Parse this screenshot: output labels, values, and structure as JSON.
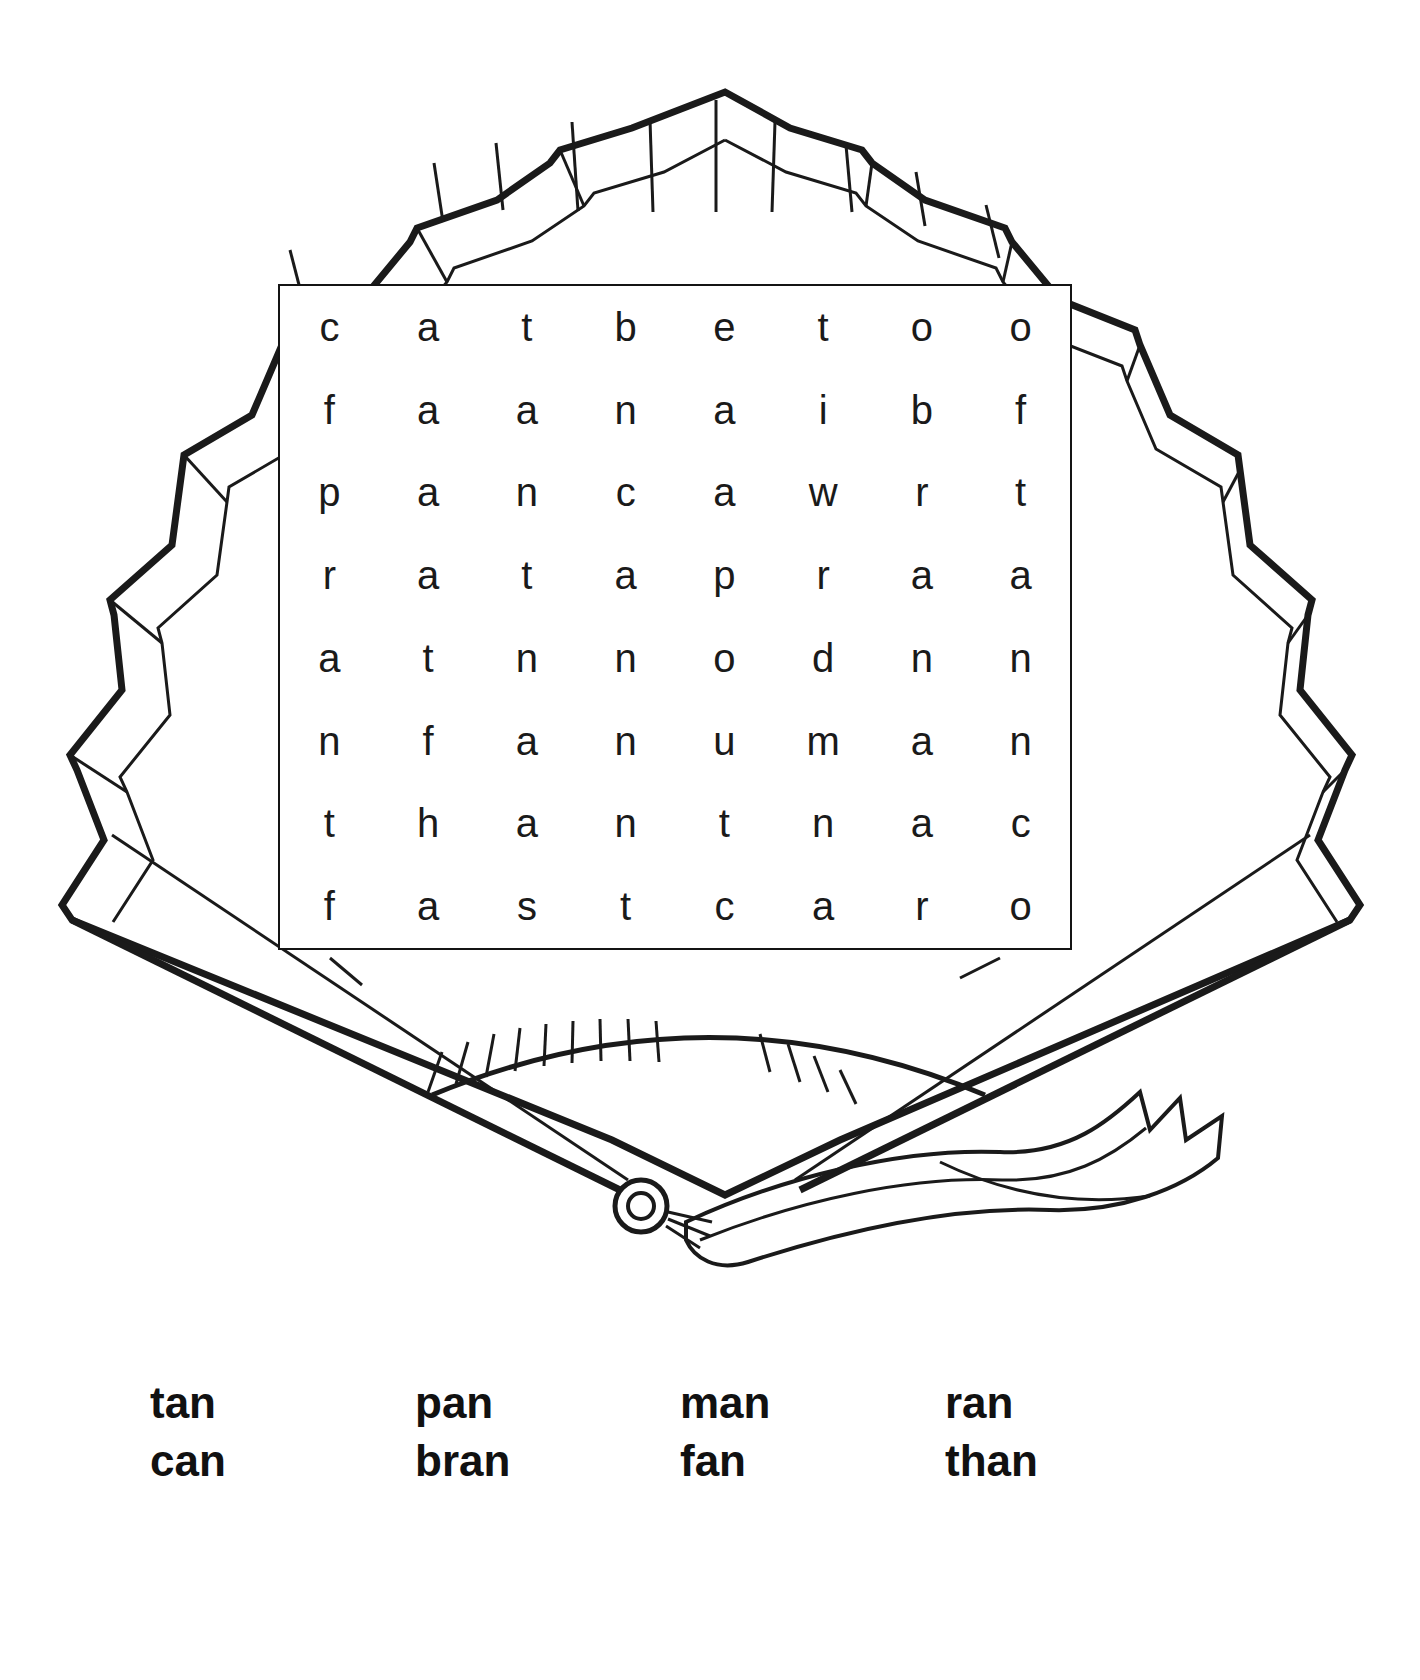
{
  "worksheet": {
    "title": "Word Search",
    "illustration_name": "decorative-folding-fan-with-ribbon"
  },
  "puzzle": {
    "rows": 8,
    "columns": 8,
    "grid": [
      [
        "c",
        "a",
        "t",
        "b",
        "e",
        "t",
        "o",
        "o"
      ],
      [
        "f",
        "a",
        "a",
        "n",
        "a",
        "i",
        "b",
        "f"
      ],
      [
        "p",
        "a",
        "n",
        "c",
        "a",
        "w",
        "r",
        "t"
      ],
      [
        "r",
        "a",
        "t",
        "a",
        "p",
        "r",
        "a",
        "a"
      ],
      [
        "a",
        "t",
        "n",
        "n",
        "o",
        "d",
        "n",
        "n"
      ],
      [
        "n",
        "f",
        "a",
        "n",
        "u",
        "m",
        "a",
        "n"
      ],
      [
        "t",
        "h",
        "a",
        "n",
        "t",
        "n",
        "a",
        "c"
      ],
      [
        "f",
        "a",
        "s",
        "t",
        "c",
        "a",
        "r",
        "o"
      ]
    ]
  },
  "word_bank": {
    "rows": [
      [
        "tan",
        "pan",
        "man",
        "ran"
      ],
      [
        "can",
        "bran",
        "fan",
        "than"
      ]
    ]
  },
  "colors": {
    "ink": "#1a1a1a",
    "outline": "#141414",
    "paper": "#ffffff"
  }
}
